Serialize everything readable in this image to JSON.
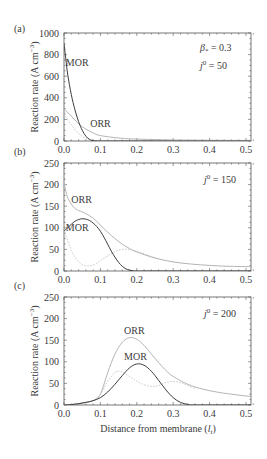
{
  "chart_data": [
    {
      "type": "line",
      "panel": "(a)",
      "xlabel": "Distance from membrane (l_t)",
      "ylabel": "Reaction rate (A cm^-3)",
      "xlim": [
        0,
        0.52
      ],
      "ylim": [
        0,
        1000
      ],
      "xticks": [
        "0.0",
        "0.1",
        "0.2",
        "0.3",
        "0.4",
        "0.5"
      ],
      "yticks": [
        "0",
        "200",
        "400",
        "600",
        "800",
        "1000"
      ],
      "annotations": [
        "β* = 0.3",
        "j0 = 50"
      ],
      "series": [
        {
          "name": "MOR",
          "style": "solid-dark",
          "x": [
            0,
            0.005,
            0.01,
            0.02,
            0.03,
            0.04,
            0.05,
            0.06,
            0.07,
            0.08,
            0.1,
            0.15,
            0.52
          ],
          "y": [
            900,
            760,
            620,
            430,
            290,
            180,
            100,
            45,
            15,
            4,
            0,
            0,
            0
          ]
        },
        {
          "name": "ORR",
          "style": "solid-light",
          "x": [
            0,
            0.02,
            0.04,
            0.06,
            0.08,
            0.1,
            0.15,
            0.2,
            0.3,
            0.4,
            0.52
          ],
          "y": [
            300,
            230,
            160,
            110,
            75,
            50,
            28,
            18,
            10,
            7,
            5
          ]
        },
        {
          "name": "dotted",
          "style": "dotted",
          "x": [
            0,
            0.02,
            0.04,
            0.06,
            0.08,
            0.1,
            0.2,
            0.52
          ],
          "y": [
            250,
            150,
            70,
            25,
            8,
            2,
            0,
            0
          ]
        }
      ],
      "labels": [
        {
          "text": "MOR",
          "x": 0.005,
          "y": 690
        },
        {
          "text": "ORR",
          "x": 0.072,
          "y": 130
        }
      ]
    },
    {
      "type": "line",
      "panel": "(b)",
      "xlabel": "Distance from membrane (l_t)",
      "ylabel": "Reaction rate (A cm^-3)",
      "xlim": [
        0,
        0.52
      ],
      "ylim": [
        0,
        250
      ],
      "xticks": [
        "0.0",
        "0.1",
        "0.2",
        "0.3",
        "0.4",
        "0.5"
      ],
      "yticks": [
        "0",
        "50",
        "100",
        "150",
        "200",
        "250"
      ],
      "annotations": [
        "j0 = 150"
      ],
      "series": [
        {
          "name": "MOR",
          "style": "solid-dark",
          "x": [
            0,
            0.01,
            0.02,
            0.03,
            0.04,
            0.05,
            0.06,
            0.07,
            0.08,
            0.09,
            0.1,
            0.11,
            0.12,
            0.13,
            0.14,
            0.15,
            0.16,
            0.17,
            0.18,
            0.19,
            0.2,
            0.25,
            0.52
          ],
          "y": [
            93,
            100,
            108,
            115,
            119,
            121,
            120,
            117,
            111,
            103,
            92,
            78,
            62,
            46,
            32,
            20,
            11,
            5,
            2,
            0.5,
            0,
            0,
            0
          ]
        },
        {
          "name": "ORR",
          "style": "solid-light",
          "x": [
            0,
            0.005,
            0.01,
            0.02,
            0.03,
            0.04,
            0.05,
            0.06,
            0.07,
            0.08,
            0.09,
            0.1,
            0.12,
            0.14,
            0.16,
            0.18,
            0.2,
            0.25,
            0.3,
            0.35,
            0.4,
            0.45,
            0.52
          ],
          "y": [
            205,
            185,
            170,
            155,
            145,
            140,
            137,
            133,
            128,
            122,
            115,
            106,
            90,
            75,
            62,
            52,
            44,
            30,
            21,
            16,
            13,
            11,
            10
          ]
        },
        {
          "name": "dotted",
          "style": "dotted",
          "x": [
            0,
            0.01,
            0.02,
            0.03,
            0.04,
            0.05,
            0.06,
            0.07,
            0.08,
            0.09,
            0.1,
            0.12,
            0.14,
            0.16,
            0.18,
            0.2,
            0.22,
            0.24,
            0.26
          ],
          "y": [
            95,
            70,
            48,
            32,
            22,
            15,
            12,
            12,
            14,
            18,
            24,
            35,
            45,
            50,
            50,
            46,
            40,
            34,
            28
          ]
        }
      ],
      "labels": [
        {
          "text": "ORR",
          "x": 0.02,
          "y": 158
        },
        {
          "text": "MOR",
          "x": 0.005,
          "y": 93
        }
      ]
    },
    {
      "type": "line",
      "panel": "(c)",
      "xlabel": "Distance from membrane (l_t)",
      "ylabel": "Reaction rate (A cm^-3)",
      "xlim": [
        0,
        0.52
      ],
      "ylim": [
        0,
        250
      ],
      "xticks": [
        "0.0",
        "0.1",
        "0.2",
        "0.3",
        "0.4",
        "0.5"
      ],
      "yticks": [
        "0",
        "50",
        "100",
        "150",
        "200",
        "250"
      ],
      "annotations": [
        "j0 = 200"
      ],
      "series": [
        {
          "name": "MOR",
          "style": "solid-dark",
          "x": [
            0,
            0.02,
            0.04,
            0.06,
            0.08,
            0.1,
            0.12,
            0.14,
            0.16,
            0.18,
            0.2,
            0.22,
            0.24,
            0.26,
            0.28,
            0.3,
            0.32,
            0.34,
            0.36,
            0.52
          ],
          "y": [
            0,
            1,
            3,
            6,
            10,
            17,
            30,
            48,
            68,
            86,
            95,
            92,
            78,
            57,
            35,
            17,
            6,
            1.5,
            0,
            0
          ]
        },
        {
          "name": "ORR",
          "style": "solid-light",
          "x": [
            0,
            0.02,
            0.04,
            0.06,
            0.08,
            0.1,
            0.12,
            0.14,
            0.16,
            0.18,
            0.2,
            0.22,
            0.24,
            0.26,
            0.28,
            0.3,
            0.34,
            0.38,
            0.42,
            0.46,
            0.52
          ],
          "y": [
            0,
            1,
            3,
            6,
            10,
            25,
            75,
            118,
            145,
            156,
            152,
            138,
            118,
            98,
            80,
            66,
            48,
            37,
            30,
            25,
            19
          ]
        },
        {
          "name": "dotted",
          "style": "dotted",
          "x": [
            0.08,
            0.1,
            0.12,
            0.14,
            0.15,
            0.16,
            0.18,
            0.2,
            0.22,
            0.24,
            0.26,
            0.28,
            0.3,
            0.32,
            0.34,
            0.36
          ],
          "y": [
            10,
            25,
            55,
            75,
            78,
            76,
            66,
            55,
            47,
            43,
            45,
            52,
            55,
            52,
            45,
            38
          ]
        }
      ],
      "labels": [
        {
          "text": "ORR",
          "x": 0.165,
          "y": 165
        },
        {
          "text": "MOR",
          "x": 0.165,
          "y": 105
        }
      ]
    }
  ],
  "panels": [
    {
      "label": "(a)",
      "ylabel": "Reaction rate (A cm",
      "ylabel_sup": "−3",
      "ylabel_close": ")",
      "anno1": "β",
      "anno1_sub": "*",
      "anno1_rest": " = 0.3",
      "anno2": "j",
      "anno2_sup": "0",
      "anno2_rest": " = 50"
    },
    {
      "label": "(b)",
      "ylabel": "Reaction rate (A cm",
      "ylabel_sup": "−3",
      "ylabel_close": ")",
      "anno2": "j",
      "anno2_sup": "0",
      "anno2_rest": " = 150"
    },
    {
      "label": "(c)",
      "ylabel": "Reaction rate (A cm",
      "ylabel_sup": "−3",
      "ylabel_close": ")",
      "anno2": "j",
      "anno2_sup": "0",
      "anno2_rest": " = 200"
    }
  ],
  "xaxis_title": "Distance from membrane (",
  "xaxis_title_var": "l",
  "xaxis_title_sub": "t",
  "xaxis_title_close": ")",
  "colors": {
    "mor": "#3c3c3c",
    "orr": "#b4b4b4",
    "dotted": "#c4c4c4",
    "axis": "#555555",
    "text": "#3a3a3a"
  }
}
